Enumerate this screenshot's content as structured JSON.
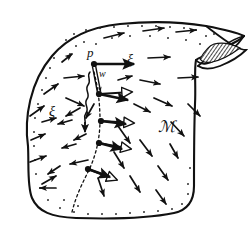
{
  "figure": {
    "name": "manifold-vector-field-diagram",
    "type": "line-drawing",
    "background_color": "#ffffff",
    "ink_color": "#111111",
    "width": 252,
    "height": 230
  },
  "labels": {
    "point_p": "p",
    "vector_w": "w",
    "field_xi_right": "ξ",
    "field_xi_left": "ξ",
    "manifold_m": "ℳ"
  },
  "label_positions": {
    "point_p": {
      "x": 87,
      "y": 57
    },
    "vector_w": {
      "x": 99,
      "y": 77
    },
    "field_xi_right": {
      "x": 127,
      "y": 64
    },
    "field_xi_left": {
      "x": 49,
      "y": 116
    },
    "manifold_m": {
      "x": 158,
      "y": 132
    }
  },
  "manifold": {
    "name": "manifold-body",
    "outline_path": "M 28,146 C 24,118 30,82 52,56 C 68,37 90,27 120,24 C 150,21 182,22 206,26 C 222,29 236,32 244,36 C 238,42 226,47 214,52 C 206,55 200,57 196,60 C 194,70 196,85 195,104 C 194,130 194,160 194,186 C 194,200 188,210 174,213 C 150,218 108,219 76,218 C 52,217 38,212 32,198 C 27,186 29,166 28,146 Z",
    "fold_paths": [
      "M 244,36 C 238,45 228,54 216,60 C 208,64 201,66 196,60",
      "M 206,26 C 214,32 224,40 234,46 C 240,49 243,50 246,50 C 240,56 230,62 220,66 C 212,69 204,70 198,66",
      "M 198,66 C 205,60 214,53 222,47 C 229,42 236,38 244,36"
    ],
    "fold_shaded_region": "M 214,44 C 222,42 232,44 240,48 C 232,54 222,60 212,62 C 206,63 202,62 200,59 C 204,52 208,46 214,44 Z",
    "stipple_color": "#222222"
  },
  "integral_curve": {
    "name": "integral-curve",
    "style": "dashed",
    "path": "M 94,72 C 98,88 100,104 100,120 C 100,138 96,156 88,172 C 82,184 76,196 72,212",
    "dash": "2.5 2.8"
  },
  "flow_nodes": [
    {
      "name": "node-p",
      "x": 94,
      "y": 64
    },
    {
      "name": "node-1",
      "x": 99,
      "y": 94
    },
    {
      "name": "node-2",
      "x": 101,
      "y": 121
    },
    {
      "name": "node-3",
      "x": 99,
      "y": 143
    },
    {
      "name": "node-4",
      "x": 88,
      "y": 169
    }
  ],
  "solid_vectors": [
    {
      "name": "xi-at-p",
      "x1": 94,
      "y1": 64,
      "x2": 134,
      "y2": 64
    },
    {
      "name": "xi-at-node-1",
      "x1": 99,
      "y1": 94,
      "x2": 128,
      "y2": 100
    },
    {
      "name": "xi-at-node-2",
      "x1": 101,
      "y1": 121,
      "x2": 126,
      "y2": 124
    },
    {
      "name": "xi-at-node-3",
      "x1": 99,
      "y1": 143,
      "x2": 122,
      "y2": 149
    },
    {
      "name": "xi-at-node-4",
      "x1": 88,
      "y1": 169,
      "x2": 110,
      "y2": 177
    }
  ],
  "hollow_vectors": [
    {
      "name": "pushforward-at-node-1",
      "x1": 99,
      "y1": 94,
      "x2": 132,
      "y2": 92
    },
    {
      "name": "pushforward-at-node-2",
      "x1": 101,
      "y1": 121,
      "x2": 134,
      "y2": 123
    },
    {
      "name": "pushforward-at-node-3",
      "x1": 99,
      "y1": 143,
      "x2": 131,
      "y2": 149
    },
    {
      "name": "pushforward-at-node-4",
      "x1": 88,
      "y1": 169,
      "x2": 117,
      "y2": 180
    }
  ],
  "w_vector": {
    "name": "w-vector",
    "x1": 94,
    "y1": 66,
    "x2": 99,
    "y2": 92,
    "style": "double-line"
  },
  "squiggle": {
    "name": "flow-squiggle",
    "path": "M 90,72 C 86,76 92,80 88,85 C 84,90 91,94 87,99 C 83,104 90,108 86,113 C 83,117 86,120 85,124",
    "arrow_tip": {
      "x": 85,
      "y": 132
    }
  },
  "field_arrows": [
    {
      "name": "field-arrow",
      "x1": 104,
      "y1": 38,
      "x2": 124,
      "y2": 33
    },
    {
      "name": "field-arrow",
      "x1": 143,
      "y1": 31,
      "x2": 164,
      "y2": 28
    },
    {
      "name": "field-arrow",
      "x1": 176,
      "y1": 32,
      "x2": 196,
      "y2": 30
    },
    {
      "name": "field-arrow",
      "x1": 148,
      "y1": 58,
      "x2": 170,
      "y2": 57
    },
    {
      "name": "field-arrow",
      "x1": 178,
      "y1": 78,
      "x2": 198,
      "y2": 77
    },
    {
      "name": "field-arrow",
      "x1": 140,
      "y1": 80,
      "x2": 160,
      "y2": 84
    },
    {
      "name": "field-arrow",
      "x1": 154,
      "y1": 98,
      "x2": 172,
      "y2": 106
    },
    {
      "name": "field-arrow",
      "x1": 134,
      "y1": 104,
      "x2": 150,
      "y2": 112
    },
    {
      "name": "field-arrow",
      "x1": 171,
      "y1": 122,
      "x2": 184,
      "y2": 136
    },
    {
      "name": "field-arrow",
      "x1": 140,
      "y1": 140,
      "x2": 152,
      "y2": 156
    },
    {
      "name": "field-arrow",
      "x1": 118,
      "y1": 126,
      "x2": 130,
      "y2": 143
    },
    {
      "name": "field-arrow",
      "x1": 114,
      "y1": 152,
      "x2": 124,
      "y2": 168
    },
    {
      "name": "field-arrow",
      "x1": 98,
      "y1": 178,
      "x2": 104,
      "y2": 196
    },
    {
      "name": "field-arrow",
      "x1": 130,
      "y1": 176,
      "x2": 140,
      "y2": 192
    },
    {
      "name": "field-arrow",
      "x1": 158,
      "y1": 166,
      "x2": 168,
      "y2": 180
    },
    {
      "name": "field-arrow",
      "x1": 156,
      "y1": 190,
      "x2": 166,
      "y2": 204
    },
    {
      "name": "field-arrow",
      "x1": 170,
      "y1": 144,
      "x2": 178,
      "y2": 158
    },
    {
      "name": "field-arrow",
      "x1": 64,
      "y1": 78,
      "x2": 84,
      "y2": 76
    },
    {
      "name": "field-arrow",
      "x1": 66,
      "y1": 98,
      "x2": 84,
      "y2": 106
    },
    {
      "name": "field-arrow",
      "x1": 44,
      "y1": 94,
      "x2": 58,
      "y2": 84
    },
    {
      "name": "field-arrow",
      "x1": 30,
      "y1": 116,
      "x2": 44,
      "y2": 106
    },
    {
      "name": "field-arrow",
      "x1": 31,
      "y1": 140,
      "x2": 45,
      "y2": 134
    },
    {
      "name": "field-arrow",
      "x1": 30,
      "y1": 162,
      "x2": 46,
      "y2": 156
    },
    {
      "name": "field-arrow",
      "x1": 42,
      "y1": 184,
      "x2": 56,
      "y2": 176
    },
    {
      "name": "field-arrow",
      "x1": 72,
      "y1": 120,
      "x2": 58,
      "y2": 124
    },
    {
      "name": "field-arrow",
      "x1": 76,
      "y1": 144,
      "x2": 62,
      "y2": 148
    },
    {
      "name": "field-arrow",
      "x1": 88,
      "y1": 160,
      "x2": 70,
      "y2": 164
    },
    {
      "name": "field-arrow",
      "x1": 56,
      "y1": 188,
      "x2": 40,
      "y2": 188
    },
    {
      "name": "field-arrow",
      "x1": 94,
      "y1": 104,
      "x2": 86,
      "y2": 118
    },
    {
      "name": "field-arrow",
      "x1": 80,
      "y1": 108,
      "x2": 66,
      "y2": 116
    },
    {
      "name": "field-arrow",
      "x1": 42,
      "y1": 122,
      "x2": 56,
      "y2": 118
    },
    {
      "name": "field-arrow",
      "x1": 60,
      "y1": 166,
      "x2": 48,
      "y2": 174
    },
    {
      "name": "field-arrow",
      "x1": 86,
      "y1": 134,
      "x2": 74,
      "y2": 140
    },
    {
      "name": "field-arrow",
      "x1": 62,
      "y1": 62,
      "x2": 72,
      "y2": 54
    },
    {
      "name": "field-arrow",
      "x1": 118,
      "y1": 80,
      "x2": 132,
      "y2": 76
    },
    {
      "name": "field-arrow",
      "x1": 188,
      "y1": 104,
      "x2": 200,
      "y2": 116
    }
  ],
  "stipple_dots": [
    {
      "x": 66,
      "y": 40
    },
    {
      "x": 74,
      "y": 34
    },
    {
      "x": 86,
      "y": 30
    },
    {
      "x": 100,
      "y": 28
    },
    {
      "x": 114,
      "y": 27
    },
    {
      "x": 128,
      "y": 26
    },
    {
      "x": 142,
      "y": 26
    },
    {
      "x": 156,
      "y": 26
    },
    {
      "x": 170,
      "y": 27
    },
    {
      "x": 184,
      "y": 28
    },
    {
      "x": 196,
      "y": 30
    },
    {
      "x": 60,
      "y": 48
    },
    {
      "x": 54,
      "y": 58
    },
    {
      "x": 50,
      "y": 68
    },
    {
      "x": 46,
      "y": 78
    },
    {
      "x": 42,
      "y": 90
    },
    {
      "x": 38,
      "y": 104
    },
    {
      "x": 35,
      "y": 118
    },
    {
      "x": 34,
      "y": 132
    },
    {
      "x": 34,
      "y": 146
    },
    {
      "x": 35,
      "y": 160
    },
    {
      "x": 36,
      "y": 174
    },
    {
      "x": 40,
      "y": 188
    },
    {
      "x": 48,
      "y": 200
    },
    {
      "x": 60,
      "y": 208
    },
    {
      "x": 74,
      "y": 212
    },
    {
      "x": 88,
      "y": 214
    },
    {
      "x": 102,
      "y": 214
    },
    {
      "x": 116,
      "y": 214
    },
    {
      "x": 130,
      "y": 213
    },
    {
      "x": 144,
      "y": 212
    },
    {
      "x": 158,
      "y": 211
    },
    {
      "x": 172,
      "y": 209
    },
    {
      "x": 182,
      "y": 204
    },
    {
      "x": 188,
      "y": 194
    },
    {
      "x": 96,
      "y": 44
    },
    {
      "x": 112,
      "y": 38
    },
    {
      "x": 130,
      "y": 36
    },
    {
      "x": 150,
      "y": 36
    },
    {
      "x": 168,
      "y": 38
    },
    {
      "x": 186,
      "y": 40
    },
    {
      "x": 200,
      "y": 44
    },
    {
      "x": 206,
      "y": 36
    },
    {
      "x": 214,
      "y": 34
    },
    {
      "x": 70,
      "y": 54
    },
    {
      "x": 76,
      "y": 46
    },
    {
      "x": 84,
      "y": 42
    },
    {
      "x": 188,
      "y": 184
    },
    {
      "x": 190,
      "y": 168
    },
    {
      "x": 78,
      "y": 206
    },
    {
      "x": 64,
      "y": 200
    }
  ]
}
